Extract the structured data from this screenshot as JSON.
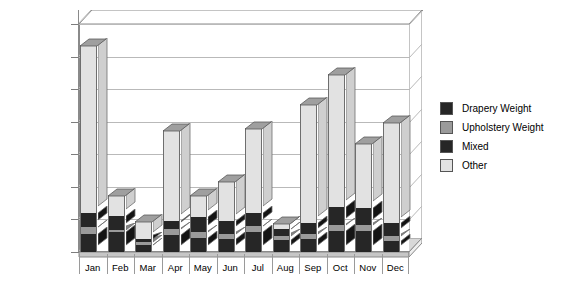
{
  "chart_data": {
    "type": "bar",
    "subtype": "stacked-column-3d",
    "title": "",
    "xlabel": "",
    "ylabel": "",
    "ylim": [
      0,
      3500
    ],
    "ytick_step": 500,
    "grid": true,
    "legend_position": "right",
    "currency_prefix": "$",
    "categories": [
      "Jan",
      "Feb",
      "Mar",
      "Apr",
      "May",
      "Jun",
      "Jul",
      "Aug",
      "Sep",
      "Oct",
      "Nov",
      "Dec"
    ],
    "ytick_labels": [
      "$0",
      "$500",
      "$1,000",
      "$1,500",
      "$2,000",
      "$2,500",
      "$3,000",
      "$3,500"
    ],
    "ytick_values": [
      0,
      500,
      1000,
      1500,
      2000,
      2500,
      3000,
      3500
    ],
    "series": [
      {
        "name": "Drapery Weight",
        "color": "#262626",
        "values": [
          280,
          300,
          110,
          260,
          220,
          200,
          300,
          180,
          200,
          320,
          330,
          170
        ]
      },
      {
        "name": "Upholstery Weight",
        "color": "#9a9a9a",
        "values": [
          110,
          40,
          40,
          90,
          90,
          80,
          100,
          60,
          70,
          90,
          80,
          80
        ]
      },
      {
        "name": "Mixed",
        "color": "#262626",
        "values": [
          210,
          210,
          50,
          130,
          230,
          190,
          200,
          110,
          180,
          280,
          270,
          190
        ]
      },
      {
        "name": "Other",
        "color": "#e2e2e2",
        "values": [
          2580,
          330,
          280,
          1390,
          340,
          620,
          1300,
          100,
          1820,
          2040,
          1000,
          1560
        ]
      }
    ],
    "totals": [
      3180,
      880,
      480,
      1870,
      880,
      1090,
      1900,
      450,
      2270,
      2730,
      1680,
      2000
    ]
  },
  "legend": {
    "items": [
      {
        "label": "Drapery Weight",
        "color": "#262626"
      },
      {
        "label": "Upholstery Weight",
        "color": "#9a9a9a"
      },
      {
        "label": "Mixed",
        "color": "#262626"
      },
      {
        "label": "Other",
        "color": "#e2e2e2"
      }
    ]
  },
  "colors": {
    "axis": "#8a8a8a",
    "grid": "#b9b9b9",
    "floor": "#d8d8d8",
    "background": "#ffffff",
    "text": "#000000"
  }
}
